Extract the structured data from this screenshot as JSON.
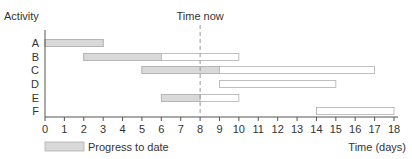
{
  "chart_data": {
    "type": "gantt",
    "title": "",
    "ylabel": "Activity",
    "xlabel": "Time (days)",
    "xlim": [
      0,
      18
    ],
    "x_ticks": [
      0,
      1,
      2,
      3,
      4,
      5,
      6,
      7,
      8,
      9,
      10,
      11,
      12,
      13,
      14,
      15,
      16,
      17,
      18
    ],
    "grid": false,
    "time_now": {
      "label": "Time now",
      "day": 8
    },
    "legend": {
      "position": "bottom-left",
      "entries": [
        {
          "label": "Progress to date",
          "color": "#d9d9d9"
        }
      ]
    },
    "activities": [
      {
        "name": "A",
        "start": 0,
        "end": 3,
        "progress_end": 3
      },
      {
        "name": "B",
        "start": 2,
        "end": 10,
        "progress_end": 6
      },
      {
        "name": "C",
        "start": 5,
        "end": 17,
        "progress_end": 9
      },
      {
        "name": "D",
        "start": 9,
        "end": 15,
        "progress_end": null
      },
      {
        "name": "E",
        "start": 6,
        "end": 10,
        "progress_end": 8
      },
      {
        "name": "F",
        "start": 14,
        "end": 18,
        "progress_end": null
      }
    ],
    "colors": {
      "progress_fill": "#d9d9d9",
      "bar_outline": "#b0b0b0",
      "axis": "#555555",
      "time_now_line": "#999999"
    }
  }
}
